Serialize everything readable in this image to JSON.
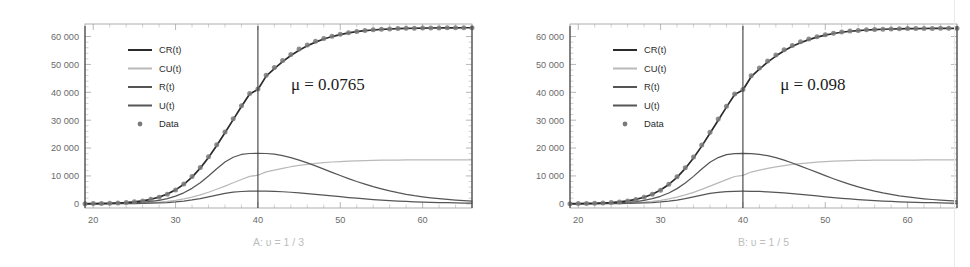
{
  "figure": {
    "panel_count": 2,
    "background_color": "#ffffff"
  },
  "colors": {
    "cr": "#2b2b2b",
    "cu": "#b9b9b9",
    "r": "#555555",
    "u": "#555555",
    "data": "#7a7a7a",
    "frame": "#9a9a9a",
    "vline": "#3c3c3c",
    "caption": "#bdbdbd",
    "tick_text": "#6a6a6a"
  },
  "chart_data": [
    {
      "type": "line",
      "panel_id": "A",
      "title": "",
      "caption": "A: υ = 1 / 3",
      "annotation": "μ = 0.0765",
      "annotation_x": 48.5,
      "annotation_y": 41000,
      "xlabel": "",
      "ylabel": "",
      "xlim": [
        19,
        66
      ],
      "ylim": [
        -1500,
        64500
      ],
      "xticks": [
        20,
        30,
        40,
        50,
        60
      ],
      "xtick_labels": [
        "20",
        "30",
        "40",
        "50",
        "60"
      ],
      "yticks": [
        0,
        10000,
        20000,
        30000,
        40000,
        50000,
        60000
      ],
      "ytick_labels": [
        "0",
        "10 000",
        "20 000",
        "30 000",
        "40 000",
        "50 000",
        "60 000"
      ],
      "grid": false,
      "legend_position": "upper-left",
      "reference_lines": [
        {
          "orientation": "vertical",
          "value": 40
        },
        {
          "orientation": "vertical",
          "value": 19
        },
        {
          "orientation": "vertical",
          "value": 66
        }
      ],
      "legend": [
        {
          "label": "CR(t)",
          "marker": "line",
          "color": "#2b2b2b"
        },
        {
          "label": "CU(t)",
          "marker": "line",
          "color": "#b9b9b9"
        },
        {
          "label": "R(t)",
          "marker": "line",
          "color": "#555555"
        },
        {
          "label": "U(t)",
          "marker": "line",
          "color": "#555555"
        },
        {
          "label": "Data",
          "marker": "dot",
          "color": "#7a7a7a"
        }
      ],
      "x": [
        19,
        20,
        21,
        22,
        23,
        24,
        25,
        26,
        27,
        28,
        29,
        30,
        31,
        32,
        33,
        34,
        35,
        36,
        37,
        38,
        39,
        40,
        41,
        42,
        43,
        44,
        45,
        46,
        47,
        48,
        49,
        50,
        51,
        52,
        53,
        54,
        55,
        56,
        57,
        58,
        59,
        60,
        61,
        62,
        63,
        64,
        65,
        66
      ],
      "series": [
        {
          "name": "CR(t)",
          "color": "#2b2b2b",
          "values": [
            60,
            90,
            140,
            210,
            320,
            480,
            720,
            1080,
            1620,
            2400,
            3500,
            5000,
            7000,
            9600,
            12800,
            16600,
            20900,
            25500,
            30200,
            34900,
            39400,
            41000,
            45800,
            48500,
            51000,
            53200,
            55100,
            56700,
            58000,
            59100,
            60000,
            60700,
            61300,
            61750,
            62100,
            62350,
            62550,
            62700,
            62820,
            62900,
            62970,
            63020,
            63060,
            63090,
            63110,
            63130,
            63150,
            63160
          ]
        },
        {
          "name": "CU(t)",
          "color": "#b9b9b9",
          "values": [
            15,
            22,
            35,
            52,
            80,
            120,
            180,
            270,
            405,
            600,
            875,
            1250,
            1750,
            2400,
            3200,
            4150,
            5225,
            6375,
            7550,
            8725,
            9850,
            10250,
            11450,
            12125,
            12750,
            13300,
            13775,
            14175,
            14500,
            14775,
            15000,
            15175,
            15325,
            15440,
            15525,
            15590,
            15640,
            15680,
            15705,
            15725,
            15740,
            15755,
            15765,
            15772,
            15778,
            15782,
            15786,
            15790
          ]
        },
        {
          "name": "R(t)",
          "color": "#555555",
          "values": [
            30,
            45,
            70,
            105,
            160,
            245,
            370,
            560,
            840,
            1270,
            1880,
            2750,
            3950,
            5550,
            7550,
            9950,
            12600,
            15000,
            16700,
            17700,
            18050,
            18100,
            18050,
            17800,
            17300,
            16600,
            15700,
            14700,
            13600,
            12450,
            11300,
            10150,
            9050,
            8000,
            7050,
            6150,
            5350,
            4620,
            3980,
            3420,
            2930,
            2510,
            2150,
            1840,
            1580,
            1350,
            1160,
            1000
          ]
        },
        {
          "name": "U(t)",
          "color": "#555555",
          "values": [
            8,
            12,
            18,
            27,
            41,
            62,
            94,
            142,
            213,
            320,
            470,
            690,
            990,
            1390,
            1890,
            2490,
            3150,
            3750,
            4180,
            4420,
            4510,
            4530,
            4510,
            4450,
            4330,
            4150,
            3930,
            3680,
            3400,
            3110,
            2830,
            2540,
            2260,
            2000,
            1760,
            1540,
            1340,
            1155,
            995,
            855,
            735,
            630,
            540,
            460,
            395,
            340,
            290,
            250
          ]
        }
      ],
      "data_points": {
        "name": "Data",
        "color": "#7a7a7a",
        "x": [
          19,
          20,
          21,
          22,
          23,
          24,
          25,
          26,
          27,
          28,
          29,
          30,
          31,
          32,
          33,
          34,
          35,
          36,
          37,
          38,
          39,
          40,
          41,
          42,
          43,
          44,
          45,
          46,
          47,
          48,
          49,
          50,
          51,
          52,
          53,
          54,
          55,
          56,
          57,
          58,
          59,
          60,
          61,
          62,
          63,
          64,
          65,
          66
        ],
        "values": [
          50,
          80,
          130,
          200,
          300,
          460,
          700,
          1050,
          1600,
          2380,
          3450,
          4950,
          7100,
          9800,
          13000,
          16900,
          21200,
          25800,
          30500,
          35200,
          39600,
          41200,
          46100,
          48900,
          51400,
          53600,
          55500,
          57000,
          58300,
          59300,
          60100,
          60800,
          61400,
          61850,
          62150,
          62400,
          62600,
          62750,
          62860,
          62940,
          63000,
          63050,
          63080,
          63110,
          63130,
          63150,
          63160,
          63170
        ]
      }
    },
    {
      "type": "line",
      "panel_id": "B",
      "title": "",
      "caption": "B: υ = 1 / 5",
      "annotation": "μ = 0.098",
      "annotation_x": 48.5,
      "annotation_y": 41000,
      "xlabel": "",
      "ylabel": "",
      "xlim": [
        19,
        66
      ],
      "ylim": [
        -1500,
        64500
      ],
      "xticks": [
        20,
        30,
        40,
        50,
        60
      ],
      "xtick_labels": [
        "20",
        "30",
        "40",
        "50",
        "60"
      ],
      "yticks": [
        0,
        10000,
        20000,
        30000,
        40000,
        50000,
        60000
      ],
      "ytick_labels": [
        "0",
        "10 000",
        "20 000",
        "30 000",
        "40 000",
        "50 000",
        "60 000"
      ],
      "grid": false,
      "legend_position": "upper-left",
      "reference_lines": [
        {
          "orientation": "vertical",
          "value": 40
        },
        {
          "orientation": "vertical",
          "value": 19
        },
        {
          "orientation": "vertical",
          "value": 66
        }
      ],
      "legend": [
        {
          "label": "CR(t)",
          "marker": "line",
          "color": "#2b2b2b"
        },
        {
          "label": "CU(t)",
          "marker": "line",
          "color": "#b9b9b9"
        },
        {
          "label": "R(t)",
          "marker": "line",
          "color": "#555555"
        },
        {
          "label": "U(t)",
          "marker": "line",
          "color": "#555555"
        },
        {
          "label": "Data",
          "marker": "dot",
          "color": "#7a7a7a"
        }
      ],
      "x": [
        19,
        20,
        21,
        22,
        23,
        24,
        25,
        26,
        27,
        28,
        29,
        30,
        31,
        32,
        33,
        34,
        35,
        36,
        37,
        38,
        39,
        40,
        41,
        42,
        43,
        44,
        45,
        46,
        47,
        48,
        49,
        50,
        51,
        52,
        53,
        54,
        55,
        56,
        57,
        58,
        59,
        60,
        61,
        62,
        63,
        64,
        65,
        66
      ],
      "series": [
        {
          "name": "CR(t)",
          "color": "#2b2b2b",
          "values": [
            55,
            85,
            135,
            205,
            310,
            470,
            710,
            1060,
            1600,
            2370,
            3450,
            4950,
            6950,
            9500,
            12700,
            16450,
            20700,
            25300,
            30000,
            34700,
            39200,
            40800,
            45600,
            48300,
            50800,
            53000,
            54900,
            56500,
            57800,
            58900,
            59800,
            60500,
            61100,
            61550,
            61900,
            62150,
            62350,
            62500,
            62620,
            62700,
            62770,
            62820,
            62860,
            62890,
            62910,
            62930,
            62950,
            62960
          ]
        },
        {
          "name": "CU(t)",
          "color": "#b9b9b9",
          "values": [
            14,
            21,
            34,
            51,
            78,
            118,
            178,
            265,
            400,
            593,
            863,
            1238,
            1738,
            2375,
            3175,
            4113,
            5175,
            6325,
            7500,
            8675,
            9800,
            10200,
            11400,
            12075,
            12700,
            13250,
            13725,
            14125,
            14450,
            14725,
            14950,
            15125,
            15275,
            15390,
            15475,
            15540,
            15590,
            15630,
            15655,
            15675,
            15690,
            15705,
            15715,
            15722,
            15728,
            15732,
            15736,
            15740
          ]
        },
        {
          "name": "R(t)",
          "color": "#555555",
          "values": [
            28,
            43,
            67,
            102,
            155,
            238,
            360,
            545,
            820,
            1240,
            1840,
            2700,
            3880,
            5450,
            7450,
            9850,
            12500,
            14900,
            16600,
            17650,
            18000,
            18080,
            18020,
            17750,
            17250,
            16550,
            15650,
            14650,
            13550,
            12400,
            11250,
            10100,
            9000,
            7960,
            7000,
            6100,
            5300,
            4570,
            3930,
            3380,
            2890,
            2470,
            2110,
            1810,
            1550,
            1330,
            1140,
            990
          ]
        },
        {
          "name": "U(t)",
          "color": "#555555",
          "values": [
            7,
            11,
            17,
            26,
            40,
            60,
            91,
            138,
            207,
            312,
            460,
            675,
            970,
            1365,
            1860,
            2455,
            3110,
            3710,
            4140,
            4390,
            4490,
            4510,
            4490,
            4430,
            4310,
            4130,
            3910,
            3660,
            3390,
            3100,
            2820,
            2530,
            2250,
            1990,
            1750,
            1530,
            1330,
            1150,
            990,
            850,
            730,
            625,
            535,
            458,
            392,
            337,
            288,
            248
          ]
        }
      ],
      "data_points": {
        "name": "Data",
        "color": "#7a7a7a",
        "x": [
          19,
          20,
          21,
          22,
          23,
          24,
          25,
          26,
          27,
          28,
          29,
          30,
          31,
          32,
          33,
          34,
          35,
          36,
          37,
          38,
          39,
          40,
          41,
          42,
          43,
          44,
          45,
          46,
          47,
          48,
          49,
          50,
          51,
          52,
          53,
          54,
          55,
          56,
          57,
          58,
          59,
          60,
          61,
          62,
          63,
          64,
          65,
          66
        ],
        "values": [
          45,
          75,
          125,
          195,
          295,
          450,
          690,
          1040,
          1580,
          2350,
          3420,
          4900,
          7050,
          9750,
          12950,
          16800,
          21100,
          25700,
          30400,
          35000,
          39400,
          41000,
          45900,
          48700,
          51200,
          53400,
          55300,
          56800,
          58100,
          59100,
          59900,
          60600,
          61200,
          61650,
          61950,
          62200,
          62400,
          62550,
          62660,
          62740,
          62800,
          62850,
          62880,
          62910,
          62930,
          62950,
          62960,
          62970
        ]
      }
    }
  ]
}
